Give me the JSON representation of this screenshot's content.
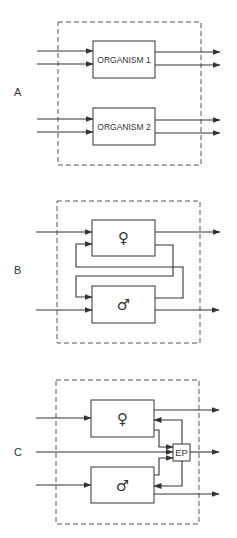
{
  "colors": {
    "line": "#333333",
    "background": "#ffffff"
  },
  "panels": [
    {
      "label": "A",
      "boxes": [
        {
          "id": "organism-1",
          "text": "ORGANISM 1"
        },
        {
          "id": "organism-2",
          "text": "ORGANISM 2"
        }
      ]
    },
    {
      "label": "B",
      "boxes": [
        {
          "id": "female",
          "text": "♀",
          "icon": "female-symbol"
        },
        {
          "id": "male",
          "text": "♂",
          "icon": "male-symbol"
        }
      ]
    },
    {
      "label": "C",
      "boxes": [
        {
          "id": "female",
          "text": "♀",
          "icon": "female-symbol"
        },
        {
          "id": "male",
          "text": "♂",
          "icon": "male-symbol"
        },
        {
          "id": "ep",
          "text": "EP"
        }
      ]
    }
  ]
}
